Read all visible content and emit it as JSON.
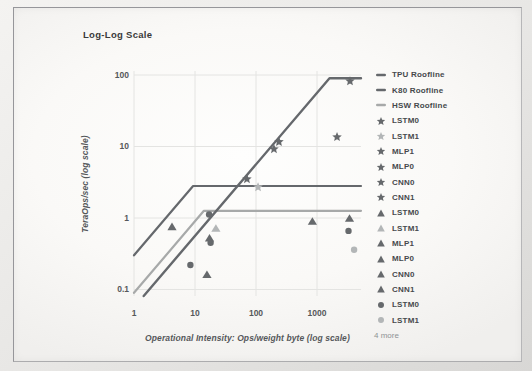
{
  "figure": {
    "title": "Log-Log Scale",
    "legend": {
      "items": [
        {
          "label": "TPU Roofline",
          "marker": "line",
          "shade": "dark"
        },
        {
          "label": "K80 Roofline",
          "marker": "line",
          "shade": "dark"
        },
        {
          "label": "HSW Roofline",
          "marker": "line",
          "shade": "light"
        },
        {
          "label": "LSTM0",
          "marker": "star",
          "shade": "dark"
        },
        {
          "label": "LSTM1",
          "marker": "star",
          "shade": "light"
        },
        {
          "label": "MLP1",
          "marker": "star",
          "shade": "dark"
        },
        {
          "label": "MLP0",
          "marker": "star",
          "shade": "dark"
        },
        {
          "label": "CNN0",
          "marker": "star",
          "shade": "dark"
        },
        {
          "label": "CNN1",
          "marker": "star",
          "shade": "dark"
        },
        {
          "label": "LSTM0",
          "marker": "triangle",
          "shade": "dark"
        },
        {
          "label": "LSTM1",
          "marker": "triangle",
          "shade": "light"
        },
        {
          "label": "MLP1",
          "marker": "triangle",
          "shade": "dark"
        },
        {
          "label": "MLP0",
          "marker": "triangle",
          "shade": "dark"
        },
        {
          "label": "CNN0",
          "marker": "triangle",
          "shade": "dark"
        },
        {
          "label": "CNN1",
          "marker": "triangle",
          "shade": "dark"
        },
        {
          "label": "LSTM0",
          "marker": "circle",
          "shade": "dark"
        },
        {
          "label": "LSTM1",
          "marker": "circle",
          "shade": "light"
        }
      ],
      "more_label": "4 more"
    }
  },
  "chart_data": {
    "type": "scatter",
    "title": "Log-Log Scale",
    "xlabel": "Operational Intensity: Ops/weight byte (log scale)",
    "ylabel": "TeraOps/sec (log scale)",
    "x_scale": "log",
    "y_scale": "log",
    "xlim": [
      1,
      5200
    ],
    "ylim": [
      0.06,
      115
    ],
    "grid": true,
    "legend_position": "right",
    "x_ticks": [
      {
        "v": 1,
        "label": "1"
      },
      {
        "v": 10,
        "label": "10"
      },
      {
        "v": 100,
        "label": "100"
      },
      {
        "v": 1000,
        "label": "1000"
      }
    ],
    "y_ticks": [
      {
        "v": 0.1,
        "label": "0.1"
      },
      {
        "v": 1,
        "label": "1"
      },
      {
        "v": 10,
        "label": "10"
      },
      {
        "v": 100,
        "label": "100"
      }
    ],
    "rooflines": [
      {
        "name": "TPU Roofline",
        "peak_teraops": 90,
        "ridge_oi": 1600,
        "shade": "dark",
        "width": 2.4
      },
      {
        "name": "K80 Roofline",
        "peak_teraops": 2.8,
        "ridge_oi": 9.3,
        "shade": "dark",
        "width": 2.2
      },
      {
        "name": "HSW Roofline",
        "peak_teraops": 1.26,
        "ridge_oi": 14,
        "shade": "light",
        "width": 2.2
      }
    ],
    "series": [
      {
        "name": "TPU",
        "marker": "star",
        "points": [
          {
            "label": "LSTM0",
            "x": 71,
            "y": 3.5,
            "shade": "dark"
          },
          {
            "label": "LSTM1",
            "x": 108,
            "y": 2.7,
            "shade": "light"
          },
          {
            "label": "MLP1",
            "x": 197,
            "y": 9.2,
            "shade": "dark"
          },
          {
            "label": "MLP0",
            "x": 238,
            "y": 11.6,
            "shade": "dark"
          },
          {
            "label": "CNN0",
            "x": 3475,
            "y": 82,
            "shade": "dark"
          },
          {
            "label": "CNN1",
            "x": 2130,
            "y": 13.6,
            "shade": "dark"
          }
        ]
      },
      {
        "name": "K80",
        "marker": "triangle",
        "points": [
          {
            "label": "LSTM0",
            "x": 4.2,
            "y": 0.75,
            "shade": "dark"
          },
          {
            "label": "LSTM1",
            "x": 22,
            "y": 0.71,
            "shade": "light"
          },
          {
            "label": "MLP1",
            "x": 17.3,
            "y": 0.52,
            "shade": "dark"
          },
          {
            "label": "MLP0",
            "x": 15.7,
            "y": 0.16,
            "shade": "dark"
          },
          {
            "label": "CNN0",
            "x": 840,
            "y": 0.89,
            "shade": "dark"
          },
          {
            "label": "CNN1",
            "x": 3410,
            "y": 0.98,
            "shade": "dark"
          }
        ]
      },
      {
        "name": "HSW",
        "marker": "circle",
        "points": [
          {
            "label": "MLP1",
            "x": 17,
            "y": 1.12,
            "shade": "dark"
          },
          {
            "label": "MLP0",
            "x": 18,
            "y": 0.45,
            "shade": "dark"
          },
          {
            "label": "LSTM0",
            "x": 8.4,
            "y": 0.22,
            "shade": "dark"
          },
          {
            "label": "CNN0",
            "x": 3280,
            "y": 0.66,
            "shade": "dark"
          },
          {
            "label": "LSTM1",
            "x": 4050,
            "y": 0.36,
            "shade": "light"
          }
        ]
      }
    ]
  },
  "colors": {
    "dark_marker": "#66696c",
    "light_marker": "#b3b6b7",
    "dark_line": "#65686c",
    "light_line": "#a7a9a9",
    "grid": "#e4e4e2",
    "title_text": "#3a3a3a",
    "axis_text": "#55585a",
    "legend_text": "#46494c",
    "muted_text": "#8f9294"
  }
}
